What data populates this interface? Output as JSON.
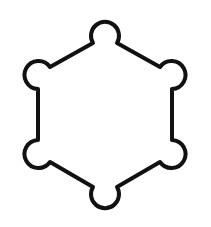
{
  "figure": {
    "description": "Hexagon outline with a circular lobe at each of its six vertices",
    "icon": "hexagon-with-lobes-icon",
    "stroke_color": "#111111",
    "background_color": "#ffffff",
    "stroke_width": 4
  }
}
